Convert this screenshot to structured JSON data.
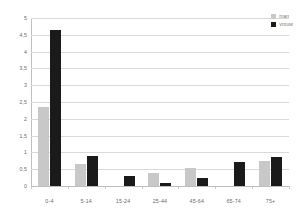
{
  "chart_data": {
    "type": "bar",
    "title": "",
    "subtitle": "",
    "xlabel": "",
    "ylabel": "",
    "categories": [
      "0-4",
      "5-14",
      "15-24",
      "25-44",
      "45-64",
      "65-74",
      "75+"
    ],
    "series": [
      {
        "name": "man",
        "color": "#c8c8c8",
        "values": [
          2.35,
          0.65,
          0.0,
          0.39,
          0.54,
          0.0,
          0.73
        ]
      },
      {
        "name": "vrouw",
        "color": "#1a1a1a",
        "values": [
          4.65,
          0.88,
          0.31,
          0.08,
          0.23,
          0.72,
          0.87
        ]
      }
    ],
    "ylim": [
      0,
      5
    ],
    "ytick_step": 0.5,
    "ytick_labels": [
      "5",
      "4,5",
      "4",
      "3,5",
      "3",
      "2,5",
      "2",
      "1,5",
      "1",
      "0,5",
      "0"
    ],
    "ytick_values": [
      5,
      4.5,
      4,
      3.5,
      3,
      2.5,
      2,
      1.5,
      1,
      0.5,
      0
    ],
    "grid": true,
    "grid_axis": "y",
    "legend_position": "top-right",
    "decimal_separator": ","
  },
  "colors": {
    "background": "#ffffff",
    "gridline": "#d9d9d9",
    "axis": "#c0c0c0",
    "tick_text": "#6b6b6b",
    "legend_text": "#7a7a7a",
    "series_man": "#c8c8c8",
    "series_vrouw": "#1a1a1a"
  }
}
